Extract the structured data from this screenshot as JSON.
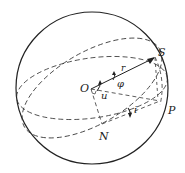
{
  "diagram": {
    "type": "celestial-sphere-orbital-elements",
    "labels": {
      "satellite": "S",
      "radius_vector": "r",
      "origin": "O",
      "latitude_angle": "φ",
      "argument_of_latitude": "u",
      "perigee_point": "P",
      "inclination": "i",
      "ascending_node": "N"
    },
    "colors": {
      "stroke": "#222222",
      "background": "#ffffff"
    }
  }
}
